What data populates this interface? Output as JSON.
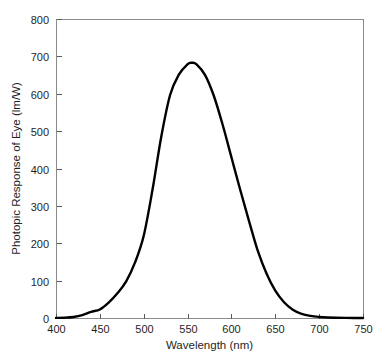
{
  "chart_data": {
    "type": "line",
    "title": "",
    "xlabel": "Wavelength (nm)",
    "ylabel": "Photopic Response of Eye (lm/W)",
    "xlim": [
      400,
      750
    ],
    "ylim": [
      0,
      800
    ],
    "xticks": [
      400,
      450,
      500,
      550,
      600,
      650,
      700,
      750
    ],
    "yticks": [
      0,
      100,
      200,
      300,
      400,
      500,
      600,
      700,
      800
    ],
    "grid": false,
    "legend": "none",
    "series": [
      {
        "name": "Photopic Response of Eye",
        "color": "#000000",
        "x": [
          400,
          410,
          420,
          430,
          440,
          450,
          460,
          470,
          480,
          490,
          500,
          510,
          520,
          530,
          540,
          550,
          555,
          560,
          570,
          580,
          590,
          600,
          610,
          620,
          630,
          640,
          650,
          660,
          670,
          680,
          690,
          700,
          710,
          720,
          730,
          740,
          750
        ],
        "y": [
          0.3,
          0.8,
          2.7,
          7.7,
          16.5,
          22.8,
          41.0,
          66.0,
          98.0,
          148.0,
          220.0,
          343.0,
          485.0,
          596.0,
          651.0,
          679.0,
          683.0,
          679.0,
          650.0,
          594.0,
          517.0,
          430.0,
          343.0,
          260.0,
          180.0,
          119.0,
          73.0,
          42.0,
          22.0,
          11.0,
          5.5,
          2.8,
          1.4,
          0.7,
          0.35,
          0.17,
          0.08
        ]
      }
    ]
  },
  "axis": {
    "x_tick_labels": [
      "400",
      "450",
      "500",
      "550",
      "600",
      "650",
      "700",
      "750"
    ],
    "y_tick_labels": [
      "0",
      "100",
      "200",
      "300",
      "400",
      "500",
      "600",
      "700",
      "800"
    ],
    "x_title": "Wavelength (nm)",
    "y_title": "Photopic Response of Eye (lm/W)"
  },
  "colors": {
    "curve": "#000000",
    "frame": "#8a8a8a",
    "tick": "#5a5a5a",
    "background": "#ffffff",
    "text": "#1f1f1f"
  },
  "geometry": {
    "plot_left": 56,
    "plot_right": 363,
    "plot_top": 19,
    "plot_bottom": 318,
    "tick_length": 5
  }
}
